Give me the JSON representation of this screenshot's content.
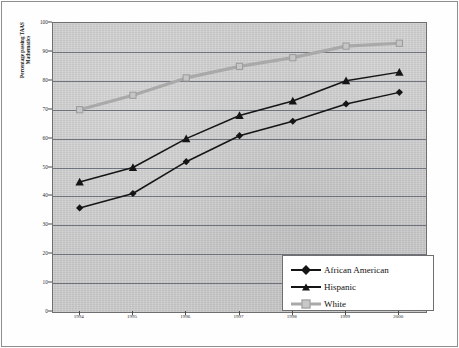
{
  "chart_data": {
    "type": "line",
    "title": "",
    "xlabel": "",
    "ylabel": "Percentage passing TAAS\nMathematics",
    "categories": [
      "1994",
      "1995",
      "1996",
      "1997",
      "1998",
      "1999",
      "2000"
    ],
    "x": [
      1994,
      1995,
      1996,
      1997,
      1998,
      1999,
      2000
    ],
    "ylim": [
      0,
      100
    ],
    "yticks": [
      0,
      10,
      20,
      30,
      40,
      50,
      60,
      70,
      80,
      90,
      100
    ],
    "grid": true,
    "legend_position": "bottom-right",
    "series": [
      {
        "name": "African American",
        "marker": "diamond",
        "color": "#151515",
        "values": [
          36,
          41,
          52,
          61,
          66,
          72,
          76
        ]
      },
      {
        "name": "Hispanic",
        "marker": "triangle",
        "color": "#151515",
        "values": [
          45,
          50,
          60,
          68,
          73,
          80,
          83
        ]
      },
      {
        "name": "White",
        "marker": "square",
        "color": "#a9a9a9",
        "values": [
          70,
          75,
          81,
          85,
          88,
          92,
          93
        ]
      }
    ]
  },
  "axis": {
    "y_tick_labels": [
      "100",
      "90",
      "80",
      "70",
      "60",
      "50",
      "40",
      "30",
      "20",
      "10",
      "0"
    ],
    "x_tick_labels": [
      "1994",
      "1995",
      "1996",
      "1997",
      "1998",
      "1999",
      "2000"
    ],
    "y_title": "Percentage passing TAAS\nMathematics"
  },
  "legend": {
    "items": [
      {
        "label": "African American"
      },
      {
        "label": "Hispanic"
      },
      {
        "label": "White"
      }
    ]
  },
  "colors": {
    "plot_background": "#cdcdcd",
    "gridline": "#5f6470",
    "dark_series": "#151515",
    "white_series": "#a9a9a9",
    "axis": "#4a4a4a",
    "legend_background": "#ffffff"
  }
}
